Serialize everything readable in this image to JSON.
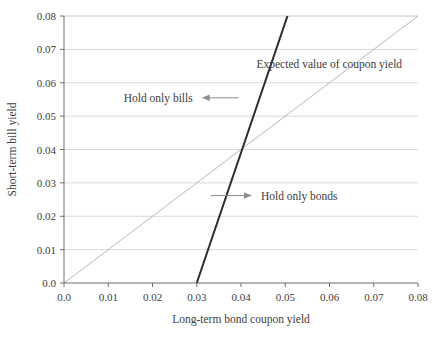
{
  "chart_data": {
    "type": "line",
    "title": "",
    "xlabel": "Long-term bond coupon yield",
    "ylabel": "Short-term bill yield",
    "xlim": [
      0.0,
      0.08
    ],
    "ylim": [
      0.0,
      0.08
    ],
    "xticks": [
      "0.0",
      "0.01",
      "0.02",
      "0.03",
      "0.04",
      "0.05",
      "0.06",
      "0.07",
      "0.08"
    ],
    "yticks": [
      "0.0",
      "0.01",
      "0.02",
      "0.03",
      "0.04",
      "0.05",
      "0.06",
      "0.07",
      "0.08"
    ],
    "xtick_values": [
      0.0,
      0.01,
      0.02,
      0.03,
      0.04,
      0.05,
      0.06,
      0.07,
      0.08
    ],
    "ytick_values": [
      0.0,
      0.01,
      0.02,
      0.03,
      0.04,
      0.05,
      0.06,
      0.07,
      0.08
    ],
    "grid": "horizontal",
    "legend": "none",
    "series": [
      {
        "name": "Expected value of coupon yield",
        "color": "#b9b9b9",
        "width": 1.0,
        "x": [
          0.0,
          0.08
        ],
        "y": [
          0.0,
          0.08
        ],
        "note": "45-degree reference line through the origin"
      },
      {
        "name": "Portfolio switching boundary",
        "color": "#2b2b2b",
        "width": 2.0,
        "x": [
          0.03,
          0.0505
        ],
        "y": [
          0.0,
          0.08
        ],
        "note": "steep line starting on the x-axis at 0.03, crossing the 45-degree line at (0.04, 0.04)"
      }
    ],
    "annotations": [
      {
        "id": "expected-value-label",
        "text": "Expected value of coupon yield",
        "x": 0.0435,
        "y": 0.0655,
        "arrow": "none"
      },
      {
        "id": "hold-only-bills-label",
        "text": "Hold only bills",
        "x": 0.0135,
        "y": 0.0555,
        "arrow": "left"
      },
      {
        "id": "hold-only-bonds-label",
        "text": "Hold only bonds",
        "x": 0.0445,
        "y": 0.0262,
        "arrow": "right"
      }
    ],
    "colors": {
      "background": "#ffffff",
      "grid": "#d9d9d9",
      "axis": "#6e6e6e",
      "text": "#404040",
      "series_light": "#b9b9b9",
      "series_dark": "#2b2b2b"
    }
  }
}
